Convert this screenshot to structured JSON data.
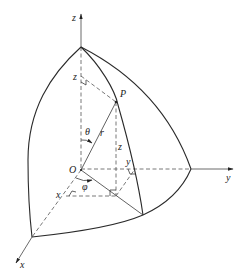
{
  "figure": {
    "labels": {
      "z_axis": "z",
      "y_axis": "y",
      "x_axis": "x",
      "origin": "O",
      "point": "P",
      "radius": "r",
      "polar_angle": "θ",
      "azimuth_angle": "φ",
      "z_on_axis": "z",
      "z_vertical": "z",
      "y_component": "y",
      "x_component": "x"
    },
    "colors": {
      "line": "#2a2a2a",
      "dashed": "#555555",
      "background": "#ffffff"
    }
  }
}
